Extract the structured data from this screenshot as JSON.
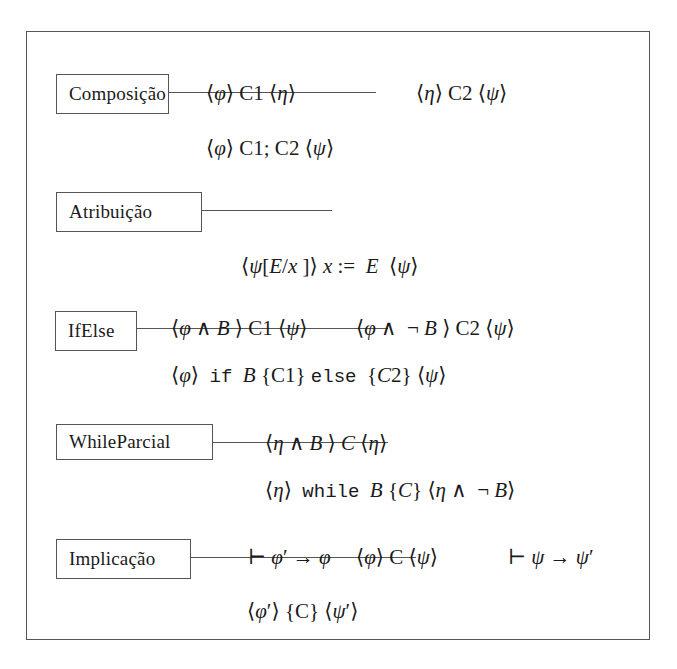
{
  "rules": [
    {
      "name": "Composição",
      "premises": [
        "⟨φ⟩ C1 ⟨η⟩",
        "⟨η⟩ C2 ⟨ψ⟩"
      ],
      "conclusion": "⟨φ⟩ C1; C2 ⟨ψ⟩"
    },
    {
      "name": "Atribuição",
      "premises": [],
      "conclusion": "⟨ψ[E/x]⟩ x := E ⟨ψ⟩"
    },
    {
      "name": "IfElse",
      "premises": [
        "⟨φ ∧ B⟩ C1 ⟨ψ⟩",
        "⟨φ ∧ ¬B⟩ C2 ⟨ψ⟩"
      ],
      "conclusion": "⟨φ⟩ if B {C1} else {C2} ⟨ψ⟩"
    },
    {
      "name": "WhileParcial",
      "premises": [
        "⟨η ∧ B⟩ C ⟨η⟩"
      ],
      "conclusion": "⟨η⟩ while B {C} ⟨η ∧ ¬B⟩"
    },
    {
      "name": "Implicação",
      "premises": [
        "⊢ φ′ → φ",
        "⟨φ⟩ C ⟨ψ⟩",
        "⊢ ψ → ψ′"
      ],
      "conclusion": "⟨φ′⟩ {C} ⟨ψ′⟩"
    }
  ],
  "glyphs": {
    "lang": "⟨",
    "rang": "⟩",
    "phi": "φ",
    "psi": "ψ",
    "eta": "η",
    "and": "∧",
    "not": "¬",
    "turnstile": "⊢",
    "implies": "→",
    "prime": "′"
  },
  "keywords": {
    "if": "if",
    "else": "else",
    "while": "while"
  },
  "colors": {
    "line": "#555555",
    "text": "#1a1a1a",
    "background": "#ffffff"
  }
}
